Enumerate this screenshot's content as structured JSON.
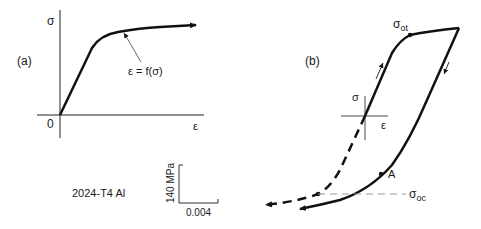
{
  "panel_a": {
    "label": "(a)",
    "y_axis_label": "σ",
    "x_axis_label": "ε",
    "origin_label": "0",
    "curve_annotation": "ε = f(σ)"
  },
  "panel_b": {
    "label": "(b)",
    "y_axis_label": "σ",
    "x_axis_label": "ε",
    "tension_yield_label": "σ",
    "tension_yield_sub": "ot",
    "compression_yield_label": "σ",
    "compression_yield_sub": "oc",
    "point_label": "A"
  },
  "material_label": "2024-T4 Al",
  "scale_bar": {
    "stress": "140 MPa",
    "strain": "0.004"
  },
  "colors": {
    "line": "#111111",
    "thin_line": "#444444",
    "dashed_ref": "#999999"
  }
}
